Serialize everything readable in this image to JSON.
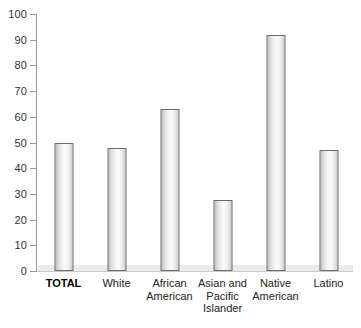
{
  "chart_data": {
    "type": "bar",
    "title": "",
    "subtitle": "",
    "xlabel": "",
    "ylabel": "",
    "ylim": [
      0,
      100
    ],
    "ytick_step": 10,
    "yticks": [
      "0",
      "10",
      "20",
      "30",
      "40",
      "50",
      "60",
      "70",
      "80",
      "90",
      "100"
    ],
    "grid": false,
    "legend": "none",
    "categories": [
      "TOTAL",
      "White",
      "African American",
      "Asian and Pacific Islander",
      "Native American",
      "Latino"
    ],
    "category_lines": [
      [
        "TOTAL"
      ],
      [
        "White"
      ],
      [
        "African",
        "American"
      ],
      [
        "Asian and",
        "Pacific",
        "Islander"
      ],
      [
        "Native",
        "American"
      ],
      [
        "Latino"
      ]
    ],
    "values": [
      50,
      48,
      63,
      27.5,
      92,
      47
    ],
    "bar_emphasis": [
      true,
      false,
      false,
      false,
      false,
      false
    ]
  },
  "style": {
    "background": "#ffffff",
    "bar_border": "#6b6b6b",
    "bar_fill_light": "#fbfbfb",
    "bar_fill_dark": "#b9b9b9",
    "axis_color": "#9a9a9a",
    "baseline_band": "#ebebeb",
    "tick_label_color": "#333333",
    "category_label_color": "#222222"
  }
}
